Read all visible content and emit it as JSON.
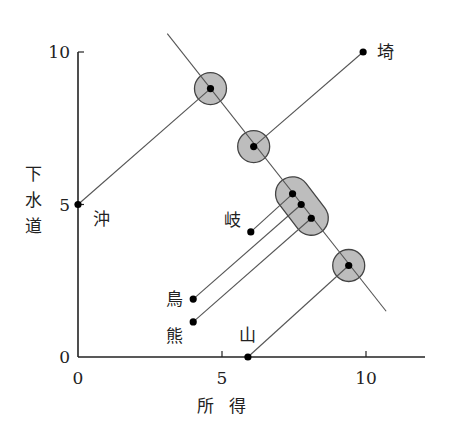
{
  "chart_data": {
    "type": "scatter",
    "title": "",
    "xlabel": "所 得",
    "ylabel": "下水道",
    "xlim": [
      0,
      12
    ],
    "ylim": [
      0,
      10
    ],
    "x_ticks": [
      0,
      5,
      10
    ],
    "y_ticks": [
      0,
      5,
      10
    ],
    "grid": false,
    "points": [
      {
        "label": "沖",
        "x": 0,
        "y": 5
      },
      {
        "label": "埼",
        "x": 9.9,
        "y": 10
      },
      {
        "label": "岐",
        "x": 6.0,
        "y": 4.1
      },
      {
        "label": "鳥",
        "x": 4.0,
        "y": 1.9
      },
      {
        "label": "熊",
        "x": 4.0,
        "y": 1.15
      },
      {
        "label": "山",
        "x": 5.9,
        "y": 0
      }
    ],
    "projected_points": [
      {
        "source": "沖",
        "x": 4.6,
        "y": 8.8,
        "group": "circle-1"
      },
      {
        "source": "埼",
        "x": 6.1,
        "y": 6.9,
        "group": "circle-2"
      },
      {
        "source": "岐",
        "x": 7.45,
        "y": 5.35,
        "group": "capsule"
      },
      {
        "source": "鳥",
        "x": 7.75,
        "y": 5.0,
        "group": "capsule"
      },
      {
        "source": "熊",
        "x": 8.1,
        "y": 4.55,
        "group": "capsule"
      },
      {
        "source": "山",
        "x": 9.4,
        "y": 3.0,
        "group": "circle-3"
      }
    ],
    "projection_line": {
      "x1": 3.1,
      "y1": 10.6,
      "x2": 10.7,
      "y2": 1.5
    },
    "annotations": "Points projected perpendicular onto a diagonal line; clusters highlighted by gray circles and a capsule"
  },
  "axis": {
    "x_tick_labels": [
      "0",
      "5",
      "10"
    ],
    "y_tick_labels": [
      "0",
      "5",
      "10"
    ],
    "xlabel_chars": [
      "所",
      "得"
    ],
    "ylabel_chars": [
      "下",
      "水",
      "道"
    ]
  },
  "colors": {
    "axis": "#222222",
    "line": "#555555",
    "highlight_fill": "#bdbdbd",
    "highlight_stroke": "#444444",
    "point": "#000000"
  }
}
